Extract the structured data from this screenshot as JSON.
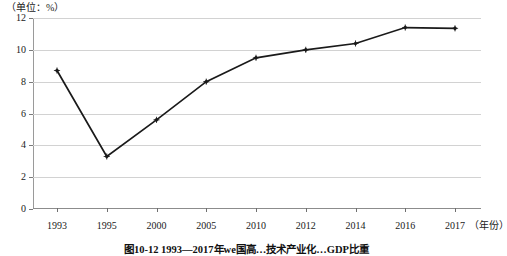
{
  "figure": {
    "unit_label": "（单位：%）",
    "xaxis_unit": "（年份）",
    "caption": "图10-12  1993—2017年we国高…技术产业化…GDP比重"
  },
  "chart_data": {
    "type": "line",
    "title": "",
    "xlabel": "年份",
    "ylabel": "",
    "unit": "%",
    "categories": [
      "1993",
      "1995",
      "2000",
      "2005",
      "2010",
      "2012",
      "2014",
      "2016",
      "2017"
    ],
    "values": [
      8.7,
      3.3,
      5.6,
      8.0,
      9.5,
      10.0,
      10.4,
      11.4,
      11.35
    ],
    "yticks": [
      0,
      2,
      4,
      6,
      8,
      10,
      12
    ],
    "ylim": [
      0,
      12
    ],
    "grid": true,
    "legend": false,
    "series_color": "#1a1a1a",
    "grid_color": "#d2d2d2",
    "marker": "diamond"
  }
}
